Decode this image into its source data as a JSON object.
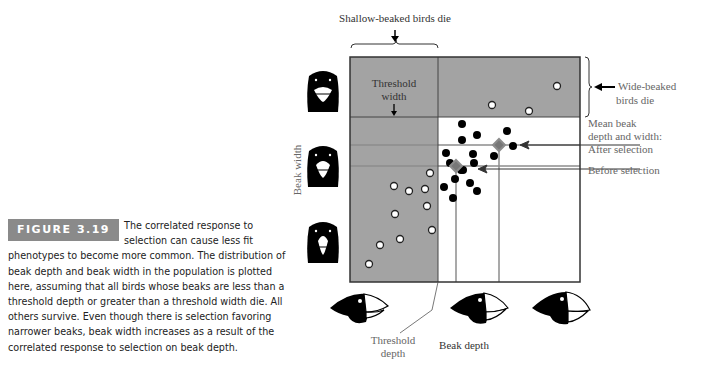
{
  "figure": {
    "badge": "FIGURE 3.19",
    "caption": "The correlated response to selection can cause less fit phenotypes to become more common. The distribution of beak depth and beak width in the population is plotted here, assuming that all birds whose beaks are less than a threshold depth or greater than a threshold width die. All others survive. Even though there is selection favoring narrower beaks, beak width increases as a result of the correlated response to selection on beak depth."
  },
  "labels": {
    "shallow_die": "Shallow-beaked birds die",
    "threshold_width_1": "Threshold",
    "threshold_width_2": "width",
    "wide_die_1": "Wide-beaked",
    "wide_die_2": "birds die",
    "mean_1": "Mean beak",
    "mean_2": "depth and width:",
    "mean_3": "After selection",
    "before": "Before selection",
    "threshold_depth_1": "Threshold",
    "threshold_depth_2": "depth",
    "x_axis": "Beak depth",
    "y_axis": "Beak width"
  },
  "colors": {
    "dead_region": "#a3a3a3",
    "survivor": "#000000",
    "dead_point": "#ffffff",
    "guide_line": "#8c8c8c",
    "frame": "#333333"
  }
}
